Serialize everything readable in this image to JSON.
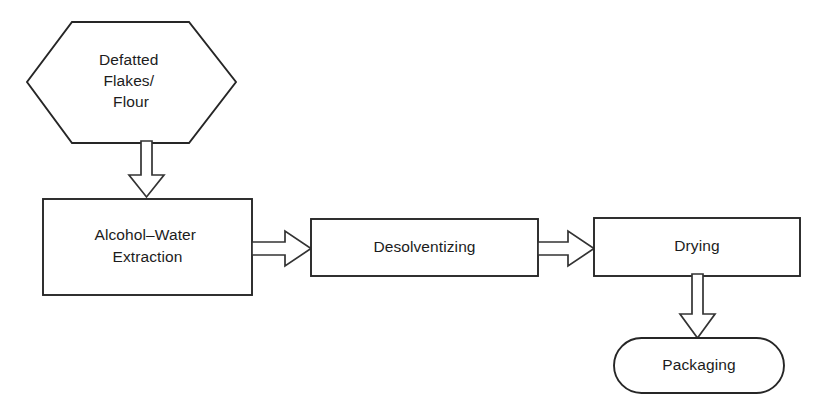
{
  "diagram": {
    "background_color": "#ffffff",
    "stroke_color": "#262626",
    "text_color": "#1c1c1c",
    "arrow_fill": "#ffffff",
    "arrow_stroke": "#333333",
    "nodes": [
      {
        "id": "defatted-flakes-flour",
        "shape": "hexagon",
        "lines": [
          "Defatted",
          "Flakes/",
          "Flour"
        ],
        "label": "Defatted Flakes/ Flour"
      },
      {
        "id": "alcohol-water-extraction",
        "shape": "rectangle",
        "lines": [
          "Alcohol–Water",
          "Extraction"
        ],
        "label": "Alcohol–Water Extraction"
      },
      {
        "id": "desolventizing",
        "shape": "rectangle",
        "lines": [
          "Desolventizing"
        ],
        "label": "Desolventizing"
      },
      {
        "id": "drying",
        "shape": "rectangle",
        "lines": [
          "Drying"
        ],
        "label": "Drying"
      },
      {
        "id": "packaging",
        "shape": "stadium",
        "lines": [
          "Packaging"
        ],
        "label": "Packaging"
      }
    ],
    "connectors": [
      {
        "id": "flakes-to-extraction",
        "from": "defatted-flakes-flour",
        "to": "alcohol-water-extraction",
        "direction": "down",
        "style": "hollow-block-arrow"
      },
      {
        "id": "extraction-to-desolventizing",
        "from": "alcohol-water-extraction",
        "to": "desolventizing",
        "direction": "right",
        "style": "hollow-block-arrow"
      },
      {
        "id": "desolventizing-to-drying",
        "from": "desolventizing",
        "to": "drying",
        "direction": "right",
        "style": "hollow-block-arrow"
      },
      {
        "id": "drying-to-packaging",
        "from": "drying",
        "to": "packaging",
        "direction": "down",
        "style": "hollow-block-arrow"
      }
    ]
  }
}
